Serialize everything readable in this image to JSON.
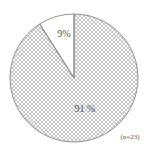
{
  "chart_data": {
    "type": "pie",
    "title": "",
    "slices": [
      {
        "label": "9%",
        "value": 9,
        "fill": "#ffffff",
        "pattern": "none"
      },
      {
        "label": "91 %",
        "value": 91,
        "fill": "#ffffff",
        "pattern": "crosshatch"
      }
    ],
    "start_angle_deg": 0,
    "direction": "counterclockwise-from-top-for-first-slice",
    "annotation": "(n=23)",
    "legend": "none"
  },
  "colors": {
    "outline": "#777777",
    "hatch": "#aaaaaa",
    "text": "#555555"
  }
}
